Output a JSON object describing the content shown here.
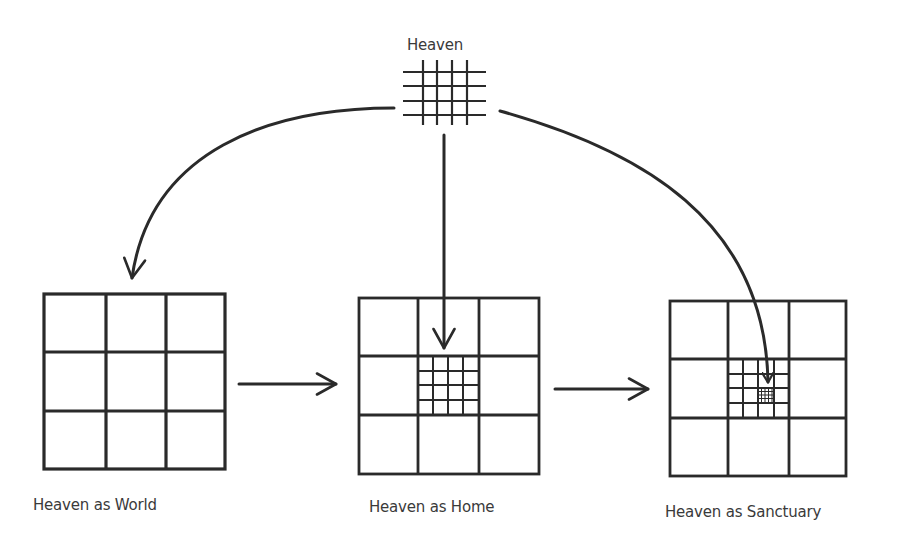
{
  "diagram": {
    "title": "Heaven",
    "nodes": [
      {
        "id": "heaven",
        "label": "Heaven",
        "glyph": "small-4x4-grid"
      },
      {
        "id": "world",
        "label": "Heaven as World",
        "glyph": "3x3-grid"
      },
      {
        "id": "home",
        "label": "Heaven as Home",
        "glyph": "3x3-grid-with-4x4-subgrid-in-center"
      },
      {
        "id": "sanctuary",
        "label": "Heaven as Sanctuary",
        "glyph": "3x3-grid-with-4x4-subgrid-and-nested-subgrid-in-center"
      }
    ],
    "edges": [
      {
        "from": "heaven",
        "to": "world",
        "style": "curved-arrow"
      },
      {
        "from": "heaven",
        "to": "home",
        "style": "straight-down-arrow"
      },
      {
        "from": "heaven",
        "to": "sanctuary",
        "style": "curved-arrow"
      },
      {
        "from": "world",
        "to": "home",
        "style": "straight-right-arrow"
      },
      {
        "from": "home",
        "to": "sanctuary",
        "style": "straight-right-arrow"
      }
    ],
    "colors": {
      "stroke": "#2a2a2a",
      "text": "#3a3a3a",
      "background": "#ffffff"
    }
  }
}
